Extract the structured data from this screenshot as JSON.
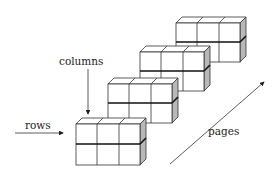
{
  "diagram": {
    "labels": {
      "columns": "columns",
      "rows": "rows",
      "pages": "pages"
    },
    "pages_count": 4,
    "rows_per_page": 2,
    "columns_per_page": 3,
    "colors": {
      "face": "#ffffff",
      "side": "#b8b8b8",
      "line": "#333333",
      "divider": "#111111"
    }
  }
}
